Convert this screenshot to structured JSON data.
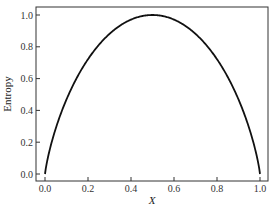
{
  "chart_data": {
    "type": "line",
    "title": "",
    "xlabel": "X",
    "ylabel": "Entropy",
    "xlim": [
      -0.05,
      1.04
    ],
    "ylim": [
      -0.07,
      1.04
    ],
    "xticks": [
      "0.0",
      "0.2",
      "0.4",
      "0.6",
      "0.8",
      "1.0"
    ],
    "yticks": [
      "0.0",
      "0.2",
      "0.4",
      "0.6",
      "0.8",
      "1.0"
    ],
    "grid": false,
    "legend": null,
    "series": [
      {
        "name": "Entropy",
        "function": "H(x) = -x*log2(x) - (1-x)*log2(1-x)",
        "color": "#111111",
        "x": [
          0.0,
          0.05,
          0.1,
          0.2,
          0.3,
          0.4,
          0.5,
          0.6,
          0.7,
          0.8,
          0.9,
          0.95,
          1.0
        ],
        "y": [
          0.0,
          0.286,
          0.469,
          0.722,
          0.881,
          0.971,
          1.0,
          0.971,
          0.881,
          0.722,
          0.469,
          0.286,
          0.0
        ]
      }
    ]
  }
}
